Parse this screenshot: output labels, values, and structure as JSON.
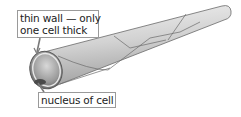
{
  "diagram": {
    "labels": {
      "wall_line1": "thin wall — only",
      "wall_line2": "one cell thick",
      "nucleus": "nucleus of cell"
    },
    "colors": {
      "tube_light": "#f2f2f2",
      "tube_mid": "#c8c8c8",
      "tube_dark": "#8a8a8a",
      "outline": "#6a6a6a",
      "lumen": "#9a9a9a",
      "label_border": "#9a9a9a"
    }
  }
}
